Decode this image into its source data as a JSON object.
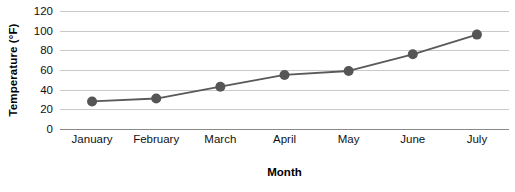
{
  "chart_data": {
    "type": "line",
    "title": "",
    "subtitle": "",
    "xlabel": "Month",
    "ylabel": "Temperature (°F)",
    "categories": [
      "January",
      "February",
      "March",
      "April",
      "May",
      "June",
      "July"
    ],
    "values": [
      28,
      31,
      43,
      55,
      59,
      76,
      96
    ],
    "series": [
      {
        "name": "Temperature",
        "values": [
          28,
          31,
          43,
          55,
          59,
          76,
          96
        ]
      }
    ],
    "ylim": [
      0,
      120
    ],
    "yticks": [
      0,
      20,
      40,
      60,
      80,
      100,
      120
    ],
    "ytick_labels": [
      "0",
      "20",
      "40",
      "60",
      "80",
      "100",
      "120"
    ],
    "grid": true,
    "legend": "none",
    "annotations": [],
    "colors": {
      "line": "#595959",
      "marker": "#555555",
      "gridline": "#c9c9c9",
      "axis": "#8a8a8a",
      "text": "#111111",
      "background": "#ffffff"
    },
    "marker": "circle",
    "marker_size": 5
  }
}
